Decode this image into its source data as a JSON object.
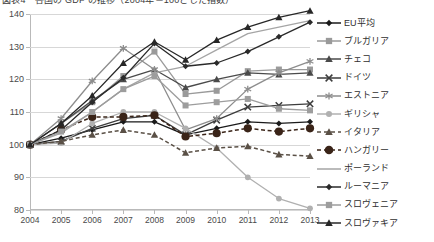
{
  "chart": {
    "title": "図表4　各国の GDP の推移（2004年＝100とした指数）",
    "xlabel": "",
    "ylabel": ""
  },
  "legend": {
    "position": "right",
    "items": [
      {
        "label": "EU平均",
        "color": "#1a1a1a",
        "marker": "diamond",
        "dash": "solid"
      },
      {
        "label": "ブルガリア",
        "color": "#9a9a9a",
        "marker": "square",
        "dash": "solid"
      },
      {
        "label": "チェコ",
        "color": "#4a4a4a",
        "marker": "triangle",
        "dash": "solid"
      },
      {
        "label": "ドイツ",
        "color": "#3d3d3d",
        "marker": "cross",
        "dash": "solid"
      },
      {
        "label": "エストニア",
        "color": "#8d8d8d",
        "marker": "star",
        "dash": "solid"
      },
      {
        "label": "ギリシャ",
        "color": "#b0b0b0",
        "marker": "circle",
        "dash": "solid"
      },
      {
        "label": "イタリア",
        "color": "#5a5046",
        "marker": "triangle",
        "dash": "dashed"
      },
      {
        "label": "ハンガリー",
        "color": "#3a2418",
        "marker": "bigcircle",
        "dash": "dashed"
      },
      {
        "label": "ポーランド",
        "color": "#a5a5a5",
        "marker": "none",
        "dash": "solid"
      },
      {
        "label": "ルーマニア",
        "color": "#2a2a2a",
        "marker": "diamond",
        "dash": "solid"
      },
      {
        "label": "スロヴェニア",
        "color": "#9d9d9d",
        "marker": "square",
        "dash": "solid"
      },
      {
        "label": "スロヴァキア",
        "color": "#272727",
        "marker": "triangle",
        "dash": "solid"
      }
    ]
  },
  "chart_data": {
    "type": "line",
    "title": "図表4　各国の GDP の推移（2004年＝100とした指数）",
    "xlabel": "",
    "ylabel": "",
    "grid": true,
    "legend_position": "right",
    "categories": [
      2004,
      2005,
      2006,
      2007,
      2008,
      2009,
      2010,
      2011,
      2012,
      2013
    ],
    "x": [
      2004,
      2005,
      2006,
      2007,
      2008,
      2009,
      2010,
      2011,
      2012,
      2013
    ],
    "xlim": [
      2004,
      2013
    ],
    "ylim": [
      80,
      140
    ],
    "yticks": [
      80,
      90,
      100,
      110,
      120,
      130,
      140
    ],
    "series": [
      {
        "name": "EU平均",
        "values": [
          100,
          102,
          104.5,
          107,
          107,
          103,
          105,
          107,
          106.5,
          107
        ]
      },
      {
        "name": "ブルガリア",
        "values": [
          100,
          106.5,
          113,
          121,
          128.5,
          115.5,
          116.5,
          122.5,
          123,
          123
        ]
      },
      {
        "name": "チェコ",
        "values": [
          100,
          106.5,
          113.5,
          120,
          123,
          117.5,
          120,
          122,
          121.5,
          122
        ]
      },
      {
        "name": "ドイツ",
        "values": [
          100,
          101,
          105,
          108,
          109,
          103,
          107.5,
          111.5,
          112,
          112.5
        ]
      },
      {
        "name": "エストニア",
        "values": [
          100,
          108,
          119.5,
          129.5,
          123,
          104.5,
          108,
          117,
          122,
          125.5
        ]
      },
      {
        "name": "ギリシャ",
        "values": [
          100,
          100.5,
          106.5,
          110,
          110,
          105,
          99,
          90,
          83.5,
          80.5
        ]
      },
      {
        "name": "イタリア",
        "values": [
          100,
          101,
          103,
          104.5,
          103,
          97.5,
          99,
          99.5,
          97,
          96.5
        ]
      },
      {
        "name": "ハンガリー",
        "values": [
          100,
          104.5,
          108.5,
          108.5,
          109,
          102.5,
          103.5,
          105,
          104,
          105
        ]
      },
      {
        "name": "ポーランド",
        "values": [
          100,
          103.5,
          110,
          117,
          122,
          124,
          129,
          134,
          136,
          138
        ]
      },
      {
        "name": "ルーマニア",
        "values": [
          100,
          104.5,
          113,
          120.5,
          131,
          124,
          125,
          128.5,
          133,
          137.5
        ]
      },
      {
        "name": "スロヴェニア",
        "values": [
          100,
          104,
          110,
          117,
          121,
          112,
          113,
          114,
          111,
          110.5
        ]
      },
      {
        "name": "スロヴァキア",
        "values": [
          100,
          106.5,
          115,
          125,
          131.5,
          126,
          132,
          136,
          139,
          141
        ]
      }
    ]
  }
}
